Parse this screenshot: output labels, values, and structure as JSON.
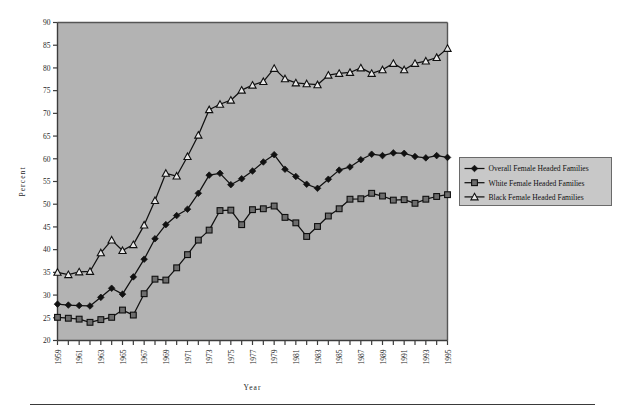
{
  "figure": {
    "name": "female-headed-families-percent-chart",
    "plot_bg_color": "#b3b3b3",
    "frame_color": "#4a4a4a",
    "page_bg_color": "#ffffff"
  },
  "axes": {
    "ylabel": "Percent",
    "xlabel": "Year"
  },
  "legend": {
    "position": "right",
    "entries": [
      {
        "label": "Overall  Female  Headed  Families",
        "marker": "filled-diamond",
        "color": "#111111"
      },
      {
        "label": "White  Female  Headed  Families",
        "marker": "filled-square",
        "color": "#111111"
      },
      {
        "label": "Black  Female  Headed  Families",
        "marker": "open-triangle",
        "color": "#111111"
      }
    ]
  },
  "chart_data": {
    "type": "line",
    "title": "",
    "subtitle": "",
    "xlabel": "Year",
    "ylabel": "Percent",
    "xlim": [
      1959,
      1995
    ],
    "ylim": [
      20,
      90
    ],
    "ytick_step": 5,
    "yticks": [
      20,
      25,
      30,
      35,
      40,
      45,
      50,
      55,
      60,
      65,
      70,
      75,
      80,
      85,
      90
    ],
    "xticks_all_years": true,
    "xtick_labels": [
      "1959",
      "1961",
      "1963",
      "1965",
      "1967",
      "1969",
      "1971",
      "1973",
      "1975",
      "1977",
      "1979",
      "1981",
      "1983",
      "1985",
      "1987",
      "1989",
      "1991",
      "1993",
      "1995"
    ],
    "grid": false,
    "legend_position": "right",
    "x": [
      1959,
      1960,
      1961,
      1962,
      1963,
      1964,
      1965,
      1966,
      1967,
      1968,
      1969,
      1970,
      1971,
      1972,
      1973,
      1974,
      1975,
      1976,
      1977,
      1978,
      1979,
      1980,
      1981,
      1982,
      1983,
      1984,
      1985,
      1986,
      1987,
      1988,
      1989,
      1990,
      1991,
      1992,
      1993,
      1994,
      1995
    ],
    "series": [
      {
        "name": "Overall  Female  Headed  Families",
        "marker": "filled-diamond",
        "color": "#111111",
        "values": [
          28.0,
          27.8,
          27.7,
          27.6,
          29.5,
          31.5,
          30.2,
          34.0,
          37.9,
          42.4,
          45.5,
          47.5,
          48.9,
          52.4,
          56.4,
          56.8,
          54.3,
          55.6,
          57.3,
          59.3,
          60.9,
          57.7,
          56.1,
          54.4,
          53.5,
          55.5,
          57.5,
          58.2,
          59.8,
          61.0,
          60.7,
          61.3,
          61.2,
          60.5,
          60.2,
          60.7,
          60.3
        ]
      },
      {
        "name": "White  Female  Headed  Families",
        "marker": "filled-square",
        "color": "#111111",
        "values": [
          25.1,
          24.9,
          24.7,
          24.0,
          24.6,
          25.1,
          26.7,
          25.6,
          30.3,
          33.5,
          33.3,
          36.0,
          38.9,
          42.1,
          44.3,
          48.6,
          48.7,
          45.5,
          48.8,
          49.0,
          49.6,
          47.1,
          45.9,
          42.9,
          45.1,
          47.4,
          49.0,
          51.1,
          51.2,
          52.4,
          51.8,
          50.9,
          51.0,
          50.2,
          51.1,
          51.7,
          52.1
        ]
      },
      {
        "name": "Black  Female  Headed  Families",
        "marker": "open-triangle",
        "color": "#111111",
        "values": [
          35.0,
          34.5,
          35.1,
          35.2,
          39.3,
          42.1,
          39.8,
          41.1,
          45.4,
          50.8,
          56.8,
          56.2,
          60.5,
          65.2,
          70.8,
          72.0,
          72.9,
          75.1,
          76.2,
          77.0,
          79.9,
          77.6,
          76.7,
          76.5,
          76.3,
          78.4,
          78.8,
          79.0,
          80.0,
          78.8,
          79.6,
          81.0,
          79.6,
          81.0,
          81.5,
          82.3,
          84.3
        ]
      }
    ]
  }
}
